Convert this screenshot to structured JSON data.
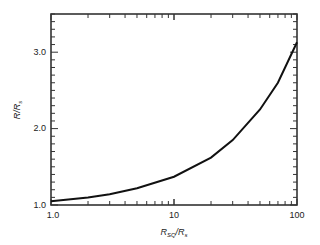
{
  "chart_data": {
    "type": "line",
    "title": "",
    "xlabel": "R_SQ/R_s",
    "ylabel": "R/R_s",
    "xscale": "log",
    "xlim": [
      1.0,
      100
    ],
    "ylim": [
      1.0,
      3.5
    ],
    "grid": false,
    "legend": null,
    "x_tick_labels": [
      "1.0",
      "10",
      "100"
    ],
    "y_tick_labels": [
      "1.0",
      "2.0",
      "3.0"
    ],
    "series": [
      {
        "name": "R/R_s",
        "x": [
          1.0,
          2.0,
          3.0,
          5.0,
          10,
          20,
          30,
          50,
          70,
          100
        ],
        "y": [
          1.05,
          1.1,
          1.14,
          1.22,
          1.37,
          1.62,
          1.85,
          2.25,
          2.6,
          3.13
        ]
      }
    ]
  },
  "axes": {
    "x": {
      "ticks": [
        "1.0",
        "10",
        "100"
      ],
      "label_main": "R",
      "label_sub": "SQ",
      "label_mid": "/R",
      "label_sub2": "s"
    },
    "y": {
      "ticks": [
        "1.0",
        "2.0",
        "3.0"
      ],
      "label_main": "R/R",
      "label_sub": "s"
    }
  }
}
